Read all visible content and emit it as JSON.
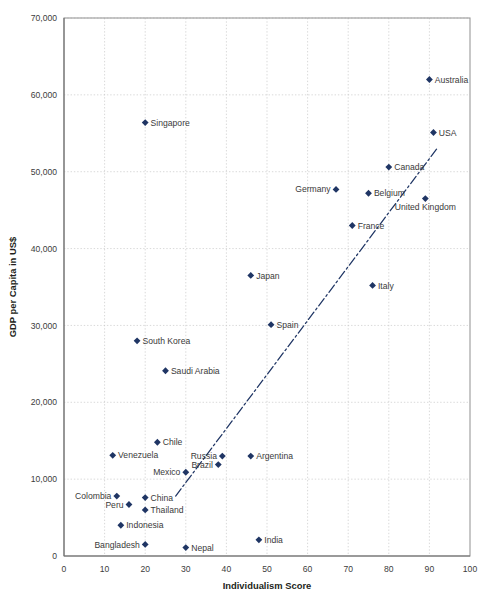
{
  "chart_data": {
    "type": "scatter",
    "title": "",
    "xlabel": "Individualism Score",
    "ylabel": "GDP per Capita in US$",
    "xlim": [
      0,
      100
    ],
    "ylim": [
      0,
      70000
    ],
    "xticks": [
      "0",
      "10",
      "20",
      "30",
      "40",
      "50",
      "60",
      "70",
      "80",
      "90",
      "100"
    ],
    "yticks": [
      "0",
      "10,000",
      "20,000",
      "30,000",
      "40,000",
      "50,000",
      "60,000",
      "70,000"
    ],
    "grid": true,
    "legend": "none",
    "marker_color": "#1f3564",
    "trendline_color": "#1f3564",
    "trendline_style": "dash-dot",
    "trendline": {
      "x1": 27.5,
      "y1": 7800,
      "x2": 92,
      "y2": 53100
    },
    "points": [
      {
        "label": "Australia",
        "x": 90,
        "y": 62000,
        "label_side": "right"
      },
      {
        "label": "Singapore",
        "x": 20,
        "y": 56400,
        "label_side": "right"
      },
      {
        "label": "USA",
        "x": 91,
        "y": 55100,
        "label_side": "right"
      },
      {
        "label": "Canada",
        "x": 80,
        "y": 50600,
        "label_side": "right"
      },
      {
        "label": "Germany",
        "x": 67,
        "y": 47700,
        "label_side": "left"
      },
      {
        "label": "Belgium",
        "x": 75,
        "y": 47200,
        "label_side": "right"
      },
      {
        "label": "United Kingdom",
        "x": 89,
        "y": 46500,
        "label_side": "below"
      },
      {
        "label": "France",
        "x": 71,
        "y": 43000,
        "label_side": "right"
      },
      {
        "label": "Japan",
        "x": 46,
        "y": 36500,
        "label_side": "right"
      },
      {
        "label": "Italy",
        "x": 76,
        "y": 35200,
        "label_side": "right"
      },
      {
        "label": "Spain",
        "x": 51,
        "y": 30100,
        "label_side": "right"
      },
      {
        "label": "South Korea",
        "x": 18,
        "y": 28000,
        "label_side": "right"
      },
      {
        "label": "Saudi Arabia",
        "x": 25,
        "y": 24100,
        "label_side": "right"
      },
      {
        "label": "Chile",
        "x": 23,
        "y": 14800,
        "label_side": "right"
      },
      {
        "label": "Venezuela",
        "x": 12,
        "y": 13100,
        "label_side": "right"
      },
      {
        "label": "Russia",
        "x": 39,
        "y": 13000,
        "label_side": "left"
      },
      {
        "label": "Argentina",
        "x": 46,
        "y": 13000,
        "label_side": "right"
      },
      {
        "label": "Brazil",
        "x": 38,
        "y": 11900,
        "label_side": "left"
      },
      {
        "label": "Mexico",
        "x": 30,
        "y": 10900,
        "label_side": "left"
      },
      {
        "label": "Colombia",
        "x": 13,
        "y": 7800,
        "label_side": "left"
      },
      {
        "label": "China",
        "x": 20,
        "y": 7600,
        "label_side": "right"
      },
      {
        "label": "Peru",
        "x": 16,
        "y": 6700,
        "label_side": "left"
      },
      {
        "label": "Thailand",
        "x": 20,
        "y": 6000,
        "label_side": "right"
      },
      {
        "label": "Indonesia",
        "x": 14,
        "y": 4000,
        "label_side": "right"
      },
      {
        "label": "Bangladesh",
        "x": 20,
        "y": 1500,
        "label_side": "left"
      },
      {
        "label": "India",
        "x": 48,
        "y": 2100,
        "label_side": "right"
      },
      {
        "label": "Nepal",
        "x": 30,
        "y": 1100,
        "label_side": "right"
      }
    ]
  },
  "footer": {
    "caption": ""
  }
}
